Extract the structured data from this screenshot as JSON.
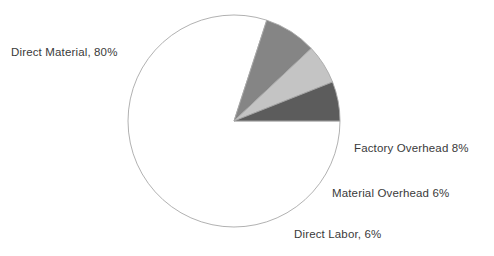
{
  "chart_data": {
    "type": "pie",
    "title": "",
    "categories": [
      "Direct Material",
      "Factory Overhead",
      "Material Overhead",
      "Direct Labor"
    ],
    "values": [
      80,
      8,
      6,
      6
    ],
    "labels": [
      "Direct Material, 80%",
      "Factory Overhead 8%",
      "Material Overhead 6%",
      "Direct Labor, 6%"
    ],
    "slice_colors": [
      "#ffffff",
      "#858585",
      "#c4c4c4",
      "#5c5c5c"
    ],
    "outline_color": "#a8a8a8",
    "start_angle_deg": 0,
    "direction": "clockwise",
    "legend": "none",
    "grid": false,
    "xlabel": "",
    "ylabel": ""
  },
  "slices": [
    {
      "name": "Direct Material",
      "label": "Direct Material, 80%",
      "percent": 80,
      "color": "#ffffff"
    },
    {
      "name": "Factory Overhead",
      "label": "Factory Overhead 8%",
      "percent": 8,
      "color": "#858585"
    },
    {
      "name": "Material Overhead",
      "label": "Material Overhead 6%",
      "percent": 6,
      "color": "#c4c4c4"
    },
    {
      "name": "Direct Labor",
      "label": "Direct Labor, 6%",
      "percent": 6,
      "color": "#5c5c5c"
    }
  ],
  "geometry": {
    "center_x": 234,
    "center_y": 121,
    "radius": 106
  }
}
